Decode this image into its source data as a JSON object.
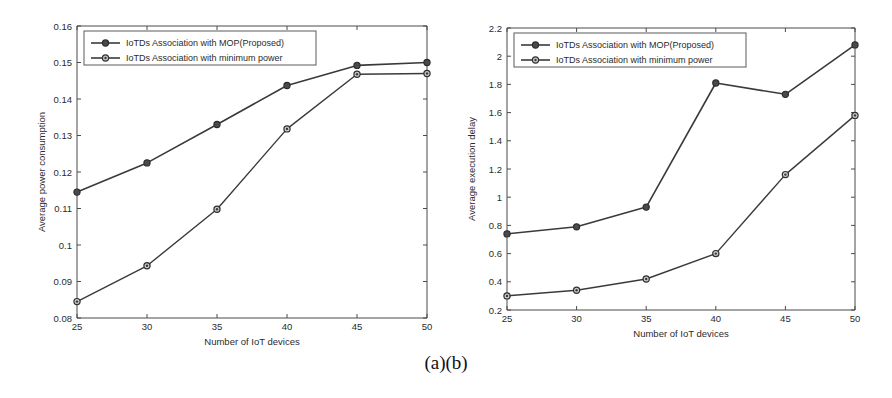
{
  "figure": {
    "caption": "(a)(b)",
    "background_color": "#ffffff",
    "line_color": "#3a3a3a",
    "axis_color": "#4a4a4a"
  },
  "legend": {
    "series1_label": "IoTDs Association with MOP(Proposed)",
    "series2_label": "IoTDs Association with minimum power"
  },
  "chart_data": [
    {
      "panel": "a",
      "type": "line",
      "title": "",
      "xlabel": "Number of IoT devices",
      "ylabel": "Average power consumption",
      "x": [
        25,
        30,
        35,
        40,
        45,
        50
      ],
      "xticklabels": [
        "25",
        "30",
        "35",
        "40",
        "45",
        "50"
      ],
      "yticklabels": [
        "0.08",
        "0.09",
        "0.1",
        "0.11",
        "0.12",
        "0.13",
        "0.14",
        "0.15",
        "0.16"
      ],
      "yticks": [
        0.08,
        0.09,
        0.1,
        0.11,
        0.12,
        0.13,
        0.14,
        0.15,
        0.16
      ],
      "xlim": [
        25,
        50
      ],
      "ylim": [
        0.08,
        0.16
      ],
      "grid": false,
      "legend_position": "upper left",
      "series": [
        {
          "name": "IoTDs Association with MOP(Proposed)",
          "values": [
            0.1145,
            0.1225,
            0.133,
            0.1437,
            0.1492,
            0.15
          ],
          "marker": "circle-filled"
        },
        {
          "name": "IoTDs Association with minimum power",
          "values": [
            0.0845,
            0.0943,
            0.1098,
            0.1318,
            0.1468,
            0.147
          ],
          "marker": "circle-hollow"
        }
      ]
    },
    {
      "panel": "b",
      "type": "line",
      "title": "",
      "xlabel": "Number of IoT devices",
      "ylabel": "Average execution delay",
      "x": [
        25,
        30,
        35,
        40,
        45,
        50
      ],
      "xticklabels": [
        "25",
        "30",
        "35",
        "40",
        "45",
        "50"
      ],
      "yticklabels": [
        "0.2",
        "0.4",
        "0.6",
        "0.8",
        "1",
        "1.2",
        "1.4",
        "1.6",
        "1.8",
        "2",
        "2.2"
      ],
      "yticks": [
        0.2,
        0.4,
        0.6,
        0.8,
        1.0,
        1.2,
        1.4,
        1.6,
        1.8,
        2.0,
        2.2
      ],
      "xlim": [
        25,
        50
      ],
      "ylim": [
        0.2,
        2.2
      ],
      "grid": false,
      "legend_position": "upper left",
      "series": [
        {
          "name": "IoTDs Association with MOP(Proposed)",
          "values": [
            0.74,
            0.79,
            0.93,
            1.81,
            1.73,
            2.08
          ],
          "marker": "circle-filled"
        },
        {
          "name": "IoTDs Association with minimum power",
          "values": [
            0.3,
            0.34,
            0.42,
            0.6,
            1.16,
            1.58
          ],
          "marker": "circle-hollow"
        }
      ]
    }
  ]
}
